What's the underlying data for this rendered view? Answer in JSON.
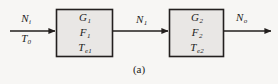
{
  "figure": {
    "caption": "(a)",
    "background_color": "#f7f6f4",
    "line_color": "#231f1e",
    "box_fill_color": "#e9e7e5",
    "box_border_color": "#231f1e"
  },
  "signals": {
    "input_power": "N",
    "input_power_sub": "i",
    "input_temperature": "T",
    "input_temperature_sub": "0",
    "intermediate_power": "N",
    "intermediate_power_sub": "1",
    "output_power": "N",
    "output_power_sub": "o"
  },
  "blocks": [
    {
      "name": "stage-1",
      "gain": "G",
      "gain_sub": "1",
      "noise_figure": "F",
      "noise_figure_sub": "1",
      "noise_temperature": "T",
      "noise_temperature_sub": "e1"
    },
    {
      "name": "stage-2",
      "gain": "G",
      "gain_sub": "2",
      "noise_figure": "F",
      "noise_figure_sub": "2",
      "noise_temperature": "T",
      "noise_temperature_sub": "e2"
    }
  ]
}
